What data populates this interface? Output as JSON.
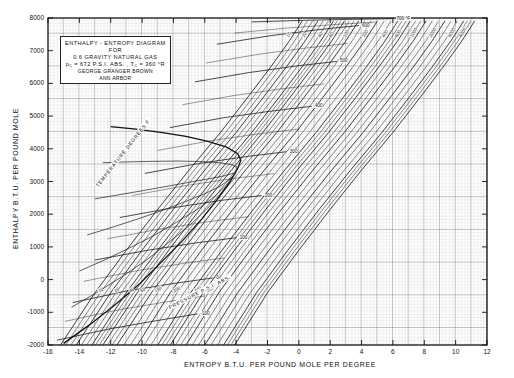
{
  "title_block": {
    "line1": "ENTHALPY - ENTROPY  DIAGRAM",
    "line2": "FOR",
    "line3": "0.6  GRAVITY  NATURAL  GAS",
    "line4_a": "p",
    "line4_sub1": "C",
    "line4_b": " = 672  P.S.I. ABS. ,  ",
    "line4_c": "T",
    "line4_sub2": "C",
    "line4_d": " = 360 °R",
    "line5": "GEORGE   GRANGER   BROWN",
    "line6": "ANN   ARBOR"
  },
  "axes": {
    "ylabel": "ENTHALPY   B.T.U. PER  POUND  MOLE",
    "xlabel": "ENTROPY      B.T.U.  PER  POUND  MOLE  PER  DEGREE",
    "yticks": [
      "8000",
      "7000",
      "6000",
      "5000",
      "4000",
      "3000",
      "2000",
      "1000",
      "0",
      "-1000",
      "-2000"
    ],
    "xticks": [
      "-16",
      "-14",
      "-12",
      "-10",
      "-8",
      "-6",
      "-4",
      "-2",
      "0",
      "2",
      "4",
      "6",
      "8",
      "10",
      "12"
    ]
  },
  "family_labels": {
    "temperature": "TEMPERATURE   DEGREES  F",
    "pressure": "PRESSURE   P.S.I. ABS."
  },
  "pressure_labels": [
    "10",
    "20",
    "40",
    "60",
    "100",
    "200",
    "400",
    "600",
    "1000",
    "2000",
    "4000",
    "6000"
  ],
  "temperature_labels": [
    "-100",
    "0",
    "100",
    "200",
    "300",
    "400",
    "500",
    "600",
    "700 °F"
  ],
  "chart_data": {
    "type": "line",
    "title": "ENTHALPY - ENTROPY DIAGRAM FOR 0.6 GRAVITY NATURAL GAS",
    "xlabel": "ENTROPY   B.T.U. PER POUND MOLE PER DEGREE",
    "ylabel": "ENTHALPY   B.T.U. PER POUND MOLE",
    "xlim": [
      -16,
      12
    ],
    "ylim": [
      -2000,
      8000
    ],
    "xtick_step": 2,
    "ytick_step": 1000,
    "grid": "fine-graph-paper",
    "legend": "none",
    "critical_pressure_psia": 672,
    "critical_temperature_R": 360,
    "gas_gravity": 0.6,
    "series": [
      {
        "name": "P = 10 psia",
        "family": "isobar",
        "points": [
          [
            -15.2,
            -2000
          ],
          [
            -13.0,
            -400
          ],
          [
            -11.0,
            900
          ],
          [
            -9.0,
            2150
          ],
          [
            -7.0,
            3350
          ],
          [
            -5.0,
            4500
          ],
          [
            -3.3,
            5550
          ],
          [
            -1.8,
            6500
          ],
          [
            -0.6,
            7300
          ],
          [
            0.2,
            7900
          ]
        ]
      },
      {
        "name": "P = 20 psia",
        "family": "isobar",
        "points": [
          [
            -14.2,
            -2000
          ],
          [
            -12.0,
            -400
          ],
          [
            -10.0,
            900
          ],
          [
            -8.0,
            2150
          ],
          [
            -6.0,
            3350
          ],
          [
            -4.0,
            4500
          ],
          [
            -2.3,
            5550
          ],
          [
            -0.8,
            6500
          ],
          [
            0.4,
            7300
          ],
          [
            1.2,
            7900
          ]
        ]
      },
      {
        "name": "P = 40 psia",
        "family": "isobar",
        "points": [
          [
            -13.2,
            -2000
          ],
          [
            -11.0,
            -400
          ],
          [
            -9.0,
            900
          ],
          [
            -7.0,
            2150
          ],
          [
            -5.0,
            3350
          ],
          [
            -3.0,
            4500
          ],
          [
            -1.3,
            5550
          ],
          [
            0.2,
            6500
          ],
          [
            1.4,
            7300
          ],
          [
            2.2,
            7900
          ]
        ]
      },
      {
        "name": "P = 60 psia",
        "family": "isobar",
        "points": [
          [
            -12.5,
            -2000
          ],
          [
            -10.3,
            -400
          ],
          [
            -8.3,
            900
          ],
          [
            -6.3,
            2150
          ],
          [
            -4.3,
            3350
          ],
          [
            -2.3,
            4500
          ],
          [
            -0.6,
            5550
          ],
          [
            0.9,
            6500
          ],
          [
            2.1,
            7300
          ],
          [
            2.9,
            7900
          ]
        ]
      },
      {
        "name": "P = 100 psia",
        "family": "isobar",
        "points": [
          [
            -11.6,
            -2000
          ],
          [
            -9.4,
            -400
          ],
          [
            -7.4,
            900
          ],
          [
            -5.4,
            2150
          ],
          [
            -3.4,
            3350
          ],
          [
            -1.4,
            4500
          ],
          [
            0.3,
            5550
          ],
          [
            1.8,
            6500
          ],
          [
            3.0,
            7300
          ],
          [
            3.8,
            7900
          ]
        ]
      },
      {
        "name": "P = 200 psia",
        "family": "isobar",
        "points": [
          [
            -10.3,
            -2000
          ],
          [
            -8.2,
            -400
          ],
          [
            -6.2,
            900
          ],
          [
            -4.2,
            2150
          ],
          [
            -2.2,
            3350
          ],
          [
            -0.2,
            4500
          ],
          [
            1.5,
            5550
          ],
          [
            3.0,
            6500
          ],
          [
            4.2,
            7300
          ],
          [
            5.0,
            7900
          ]
        ]
      },
      {
        "name": "P = 400 psia",
        "family": "isobar",
        "points": [
          [
            -9.0,
            -2000
          ],
          [
            -6.9,
            -400
          ],
          [
            -4.9,
            900
          ],
          [
            -2.9,
            2150
          ],
          [
            -0.9,
            3350
          ],
          [
            1.1,
            4500
          ],
          [
            2.8,
            5550
          ],
          [
            4.3,
            6500
          ],
          [
            5.5,
            7300
          ],
          [
            6.3,
            7900
          ]
        ]
      },
      {
        "name": "P = 600 psia",
        "family": "isobar",
        "points": [
          [
            -8.2,
            -2000
          ],
          [
            -6.1,
            -400
          ],
          [
            -4.1,
            900
          ],
          [
            -2.1,
            2150
          ],
          [
            -0.1,
            3350
          ],
          [
            1.9,
            4500
          ],
          [
            3.6,
            5550
          ],
          [
            5.1,
            6500
          ],
          [
            6.3,
            7300
          ],
          [
            7.1,
            7900
          ]
        ]
      },
      {
        "name": "P = 1000 psia",
        "family": "isobar",
        "points": [
          [
            -7.2,
            -2000
          ],
          [
            -5.1,
            -400
          ],
          [
            -3.1,
            900
          ],
          [
            -1.1,
            2150
          ],
          [
            0.9,
            3350
          ],
          [
            2.9,
            4500
          ],
          [
            4.6,
            5550
          ],
          [
            6.1,
            6500
          ],
          [
            7.3,
            7300
          ],
          [
            8.1,
            7900
          ]
        ]
      },
      {
        "name": "P = 2000 psia",
        "family": "isobar",
        "points": [
          [
            -6.0,
            -2000
          ],
          [
            -3.9,
            -400
          ],
          [
            -1.9,
            900
          ],
          [
            0.1,
            2150
          ],
          [
            2.1,
            3350
          ],
          [
            4.1,
            4500
          ],
          [
            5.8,
            5550
          ],
          [
            7.3,
            6500
          ],
          [
            8.5,
            7300
          ],
          [
            9.3,
            7900
          ]
        ]
      },
      {
        "name": "P = 4000 psia",
        "family": "isobar",
        "points": [
          [
            -4.8,
            -2000
          ],
          [
            -2.7,
            -400
          ],
          [
            -0.7,
            900
          ],
          [
            1.3,
            2150
          ],
          [
            3.3,
            3350
          ],
          [
            5.3,
            4500
          ],
          [
            7.0,
            5550
          ],
          [
            8.5,
            6500
          ],
          [
            9.7,
            7300
          ],
          [
            10.5,
            7900
          ]
        ]
      },
      {
        "name": "P = 6000 psia",
        "family": "isobar",
        "points": [
          [
            -4.1,
            -2000
          ],
          [
            -2.0,
            -400
          ],
          [
            0.0,
            900
          ],
          [
            2.0,
            2150
          ],
          [
            4.0,
            3350
          ],
          [
            6.0,
            4500
          ],
          [
            7.7,
            5550
          ],
          [
            9.2,
            6500
          ],
          [
            10.4,
            7300
          ],
          [
            11.2,
            7900
          ]
        ]
      },
      {
        "name": "T = -100 F",
        "family": "isotherm",
        "points": [
          [
            -15.4,
            -1850
          ],
          [
            -12.0,
            -1500
          ],
          [
            -9.0,
            -1250
          ],
          [
            -6.5,
            -1050
          ]
        ]
      },
      {
        "name": "T = 0 F",
        "family": "isotherm",
        "points": [
          [
            -14.4,
            -700
          ],
          [
            -11.0,
            -350
          ],
          [
            -8.0,
            -120
          ],
          [
            -5.5,
            50
          ]
        ]
      },
      {
        "name": "T = 100 F",
        "family": "isotherm",
        "points": [
          [
            -13.0,
            600
          ],
          [
            -9.6,
            900
          ],
          [
            -6.6,
            1120
          ],
          [
            -4.0,
            1280
          ]
        ]
      },
      {
        "name": "T = 200 F",
        "family": "isotherm",
        "points": [
          [
            -11.4,
            1900
          ],
          [
            -8.0,
            2200
          ],
          [
            -5.0,
            2420
          ],
          [
            -2.4,
            2570
          ]
        ]
      },
      {
        "name": "T = 300 F",
        "family": "isotherm",
        "points": [
          [
            -9.8,
            3250
          ],
          [
            -6.4,
            3550
          ],
          [
            -3.4,
            3760
          ],
          [
            -0.8,
            3910
          ]
        ]
      },
      {
        "name": "T = 400 F",
        "family": "isotherm",
        "points": [
          [
            -8.2,
            4650
          ],
          [
            -4.8,
            4950
          ],
          [
            -1.8,
            5150
          ],
          [
            0.8,
            5300
          ]
        ]
      },
      {
        "name": "T = 500 F",
        "family": "isotherm",
        "points": [
          [
            -6.6,
            6050
          ],
          [
            -3.2,
            6330
          ],
          [
            -0.2,
            6530
          ],
          [
            2.4,
            6670
          ]
        ]
      },
      {
        "name": "T = 600 F",
        "family": "isotherm",
        "points": [
          [
            -5.2,
            7200
          ],
          [
            -1.8,
            7460
          ],
          [
            1.2,
            7640
          ],
          [
            3.8,
            7770
          ]
        ]
      },
      {
        "name": "T = 700 F",
        "family": "isotherm",
        "points": [
          [
            -3.0,
            7880
          ],
          [
            0.4,
            7930
          ],
          [
            3.4,
            7960
          ],
          [
            6.0,
            7980
          ]
        ]
      }
    ]
  }
}
